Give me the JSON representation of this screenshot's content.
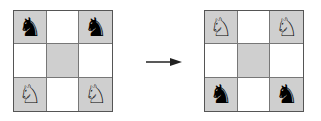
{
  "colors": {
    "shaded_square": "#cfcfcf",
    "plain_square": "#ffffff",
    "border": "#555555",
    "arrow": "#222222"
  },
  "glyphs": {
    "black_knight": "♞",
    "white_knight": "♘",
    "empty": ""
  },
  "boards": [
    {
      "label": "initial",
      "cells": [
        {
          "shade": "shaded",
          "piece": "♞",
          "piece_name": "black-knight"
        },
        {
          "shade": "plain",
          "piece": "",
          "piece_name": "empty"
        },
        {
          "shade": "shaded",
          "piece": "♞",
          "piece_name": "black-knight"
        },
        {
          "shade": "plain",
          "piece": "",
          "piece_name": "empty"
        },
        {
          "shade": "shaded",
          "piece": "",
          "piece_name": "empty"
        },
        {
          "shade": "plain",
          "piece": "",
          "piece_name": "empty"
        },
        {
          "shade": "shaded",
          "piece": "♘",
          "piece_name": "white-knight"
        },
        {
          "shade": "plain",
          "piece": "",
          "piece_name": "empty"
        },
        {
          "shade": "shaded",
          "piece": "♘",
          "piece_name": "white-knight"
        }
      ]
    },
    {
      "label": "goal",
      "cells": [
        {
          "shade": "shaded",
          "piece": "♘",
          "piece_name": "white-knight"
        },
        {
          "shade": "plain",
          "piece": "",
          "piece_name": "empty"
        },
        {
          "shade": "shaded",
          "piece": "♘",
          "piece_name": "white-knight"
        },
        {
          "shade": "plain",
          "piece": "",
          "piece_name": "empty"
        },
        {
          "shade": "shaded",
          "piece": "",
          "piece_name": "empty"
        },
        {
          "shade": "plain",
          "piece": "",
          "piece_name": "empty"
        },
        {
          "shade": "shaded",
          "piece": "♞",
          "piece_name": "black-knight"
        },
        {
          "shade": "plain",
          "piece": "",
          "piece_name": "empty"
        },
        {
          "shade": "shaded",
          "piece": "♞",
          "piece_name": "black-knight"
        }
      ]
    }
  ],
  "arrow": {
    "direction": "right",
    "meaning": "transforms-to"
  }
}
